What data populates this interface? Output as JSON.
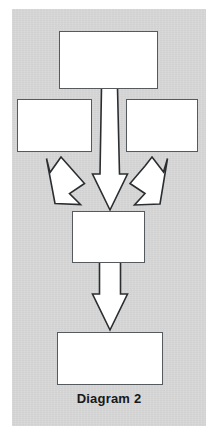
{
  "figure": {
    "caption": "Diagram 2",
    "panel_color": "#d6d6d6",
    "node_fill": "#ffffff",
    "node_stroke": "#555a5e",
    "arrow_fill": "#ffffff",
    "arrow_stroke": "#2b2e31",
    "background_color": "#ffffff"
  },
  "nodes": [
    {
      "id": "node-top",
      "label": "",
      "x": 59,
      "y": 31,
      "w": 99,
      "h": 58
    },
    {
      "id": "node-middle-left",
      "label": "",
      "x": 17,
      "y": 99,
      "w": 75,
      "h": 53
    },
    {
      "id": "node-middle-right",
      "label": "",
      "x": 126,
      "y": 99,
      "w": 72,
      "h": 53
    },
    {
      "id": "node-center",
      "label": "",
      "x": 72,
      "y": 211,
      "w": 73,
      "h": 52
    },
    {
      "id": "node-bottom",
      "label": "",
      "x": 57,
      "y": 332,
      "w": 106,
      "h": 53
    }
  ],
  "connectors": [
    {
      "id": "arrow-top-to-center",
      "kind": "block-arrow",
      "direction": "down",
      "from": "node-top",
      "to": "node-center"
    },
    {
      "id": "arrow-middle-left-to-center",
      "kind": "block-arrow",
      "direction": "down-right",
      "from": "node-middle-left",
      "to": "node-center"
    },
    {
      "id": "arrow-middle-right-to-center",
      "kind": "block-arrow",
      "direction": "down-left",
      "from": "node-middle-right",
      "to": "node-center"
    },
    {
      "id": "arrow-center-to-bottom",
      "kind": "block-arrow",
      "direction": "down",
      "from": "node-center",
      "to": "node-bottom"
    }
  ]
}
